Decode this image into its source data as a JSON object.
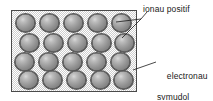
{
  "diagram": {
    "box": {
      "name": "metal lattice",
      "x": 11,
      "y": 10,
      "width": 126,
      "height": 82,
      "background_color": "#cfcfcf",
      "border_color": "#4a4a4a",
      "fill_description": "stippled halftone texture"
    },
    "ions": {
      "count": 20,
      "rows": 4,
      "per_row": 5,
      "color_light": "#d8d8d8",
      "color_dark": "#6e6e6e",
      "outline_color": "#555555",
      "positions": [
        [
          {
            "x": 15,
            "y": 13
          },
          {
            "x": 39,
            "y": 13
          },
          {
            "x": 63,
            "y": 13
          },
          {
            "x": 87,
            "y": 13
          },
          {
            "x": 110,
            "y": 13
          }
        ],
        [
          {
            "x": 19,
            "y": 33
          },
          {
            "x": 43,
            "y": 33
          },
          {
            "x": 67,
            "y": 33
          },
          {
            "x": 91,
            "y": 33
          },
          {
            "x": 113,
            "y": 33
          }
        ],
        [
          {
            "x": 14,
            "y": 52
          },
          {
            "x": 38,
            "y": 52
          },
          {
            "x": 62,
            "y": 52
          },
          {
            "x": 86,
            "y": 52
          },
          {
            "x": 110,
            "y": 52
          }
        ],
        [
          {
            "x": 18,
            "y": 70
          },
          {
            "x": 42,
            "y": 70
          },
          {
            "x": 66,
            "y": 70
          },
          {
            "x": 90,
            "y": 70
          },
          {
            "x": 113,
            "y": 70
          }
        ]
      ]
    },
    "labels": {
      "ions": {
        "text": "ionau positif",
        "x": 143,
        "y": 4
      },
      "electrons": {
        "line1": "electronau",
        "line2": "symudol",
        "x": 157,
        "y": 60
      }
    },
    "leader_lines": [
      {
        "name": "ions-leader-upper",
        "from": [
          141,
          19
        ],
        "to": [
          116,
          22
        ]
      },
      {
        "name": "ions-leader-lower",
        "from": [
          141,
          19
        ],
        "to": [
          122,
          38
        ]
      },
      {
        "name": "ions-leader-stem",
        "from": [
          141,
          19
        ],
        "to": [
          146,
          13
        ]
      },
      {
        "name": "electrons-leader",
        "from": [
          156,
          62
        ],
        "to": [
          133,
          70
        ]
      }
    ],
    "line_color": "#1a1a1a"
  }
}
